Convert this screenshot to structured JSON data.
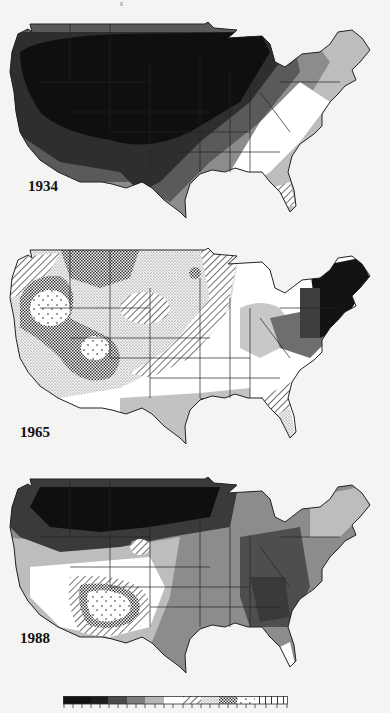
{
  "figure": {
    "top_fragment": "g",
    "panels": [
      {
        "year": "1934",
        "description": "Most of central and western US in darkest class; graded lighter toward southeast; southern Florida hatched"
      },
      {
        "year": "1965",
        "description": "West and plains in patterned (wet) classes; northeast in darkest class; lower Mississippi valley medium gray"
      },
      {
        "year": "1988",
        "description": "Northern plains darkest; southwest patterned/dotted center over Arizona/New Mexico; southeast dark gray"
      }
    ],
    "legend": {
      "classes": [
        {
          "fill": "#111111",
          "pattern": "solid"
        },
        {
          "fill": "#1c1c1c",
          "pattern": "solid"
        },
        {
          "fill": "#2e2e2e",
          "pattern": "solid"
        },
        {
          "fill": "#5a5a5a",
          "pattern": "solid"
        },
        {
          "fill": "#8c8c8c",
          "pattern": "solid"
        },
        {
          "fill": "#bdbdbd",
          "pattern": "solid"
        },
        {
          "fill": "#ffffff",
          "pattern": "solid"
        },
        {
          "fill": "#ffffff",
          "pattern": "diagonal-hatch"
        },
        {
          "fill": "#ffffff",
          "pattern": "fine-stipple"
        },
        {
          "fill": "#ffffff",
          "pattern": "crosshatch"
        },
        {
          "fill": "#ffffff",
          "pattern": "sparse-dots"
        },
        {
          "fill": "#ffffff",
          "pattern": "vertical-bars"
        }
      ],
      "tick_count": 24
    }
  }
}
